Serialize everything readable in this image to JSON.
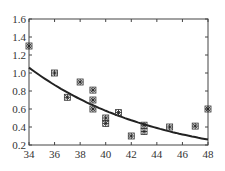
{
  "chart_data": {
    "type": "scatter",
    "title": "",
    "xlabel": "",
    "ylabel": "",
    "xlim": [
      34,
      48
    ],
    "ylim": [
      0.2,
      1.6
    ],
    "x_ticks": [
      "34",
      "36",
      "38",
      "40",
      "42",
      "44",
      "46",
      "48"
    ],
    "y_ticks": [
      "0.2",
      "0.4",
      "0.6",
      "0.8",
      "1.0",
      "1.2",
      "1.4",
      "1.6"
    ],
    "grid": false,
    "legend": null,
    "series": [
      {
        "name": "observed",
        "marker": "asterisk-square",
        "points": [
          [
            34,
            1.3
          ],
          [
            36,
            1.0
          ],
          [
            37,
            0.73
          ],
          [
            38,
            0.9
          ],
          [
            39,
            0.81
          ],
          [
            39,
            0.7
          ],
          [
            39,
            0.6
          ],
          [
            40,
            0.5
          ],
          [
            40,
            0.44
          ],
          [
            41,
            0.56
          ],
          [
            42,
            0.3
          ],
          [
            43,
            0.42
          ],
          [
            43,
            0.35
          ],
          [
            45,
            0.4
          ],
          [
            47,
            0.41
          ],
          [
            48,
            0.6
          ]
        ]
      },
      {
        "name": "fitted curve",
        "type": "line",
        "points": [
          [
            34,
            1.06
          ],
          [
            36,
            0.95
          ],
          [
            38,
            0.8
          ],
          [
            40,
            0.67
          ],
          [
            42,
            0.56
          ],
          [
            44,
            0.46
          ],
          [
            46,
            0.36
          ],
          [
            48,
            0.26
          ]
        ]
      }
    ]
  }
}
